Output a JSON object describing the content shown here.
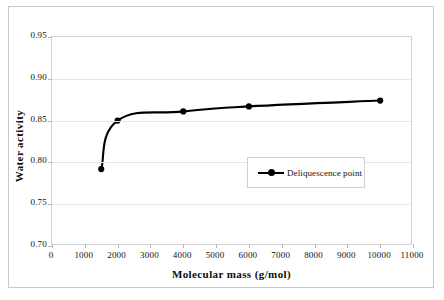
{
  "chart_data": {
    "type": "line",
    "title": "",
    "xlabel": "Molecular mass (g/mol)",
    "ylabel": "Water activity",
    "xlim": [
      0,
      11000
    ],
    "ylim": [
      0.7,
      0.95
    ],
    "grid": true,
    "legend_position": "center-right-inside",
    "xticks": [
      0,
      1000,
      2000,
      3000,
      4000,
      5000,
      6000,
      7000,
      8000,
      9000,
      10000,
      11000
    ],
    "xtick_labels": [
      "0",
      "1000",
      "2000",
      "3000",
      "4000",
      "5000",
      "6000",
      "7000",
      "8000",
      "9000",
      "10000",
      "11000"
    ],
    "yticks": [
      0.7,
      0.75,
      0.8,
      0.85,
      0.9,
      0.95
    ],
    "ytick_labels": [
      "0.70",
      "0.75",
      "0.80",
      "0.85",
      "0.90",
      "0.95"
    ],
    "series": [
      {
        "name": "Deliquescence point",
        "color": "#000000",
        "marker": "circle",
        "x": [
          1500,
          2000,
          4000,
          6000,
          10000
        ],
        "y": [
          0.792,
          0.85,
          0.861,
          0.867,
          0.874
        ]
      }
    ]
  },
  "legend": {
    "entries": [
      {
        "label": "Deliquescence point"
      }
    ]
  },
  "axes": {
    "x_title": "Molecular mass (g/mol)",
    "y_title": "Water activity"
  }
}
